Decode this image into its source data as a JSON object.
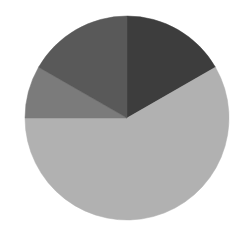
{
  "chart_data": {
    "type": "pie",
    "title": "",
    "legend": "none",
    "start_angle_deg": 90,
    "direction": "clockwise",
    "center": [
      127,
      118
    ],
    "radius": 102,
    "slices": [
      {
        "name": "Slice 1",
        "value": 16.7,
        "angle_deg": 60,
        "color": "#3d3d3d"
      },
      {
        "name": "Slice 2",
        "value": 58.3,
        "angle_deg": 210,
        "color": "#b1b1b1"
      },
      {
        "name": "Slice 3",
        "value": 8.3,
        "angle_deg": 30,
        "color": "#7b7b7b"
      },
      {
        "name": "Slice 4",
        "value": 16.7,
        "angle_deg": 60,
        "color": "#595959"
      }
    ],
    "values": [
      16.7,
      58.3,
      8.3,
      16.7
    ],
    "categories": [
      "Slice 1",
      "Slice 2",
      "Slice 3",
      "Slice 4"
    ]
  }
}
